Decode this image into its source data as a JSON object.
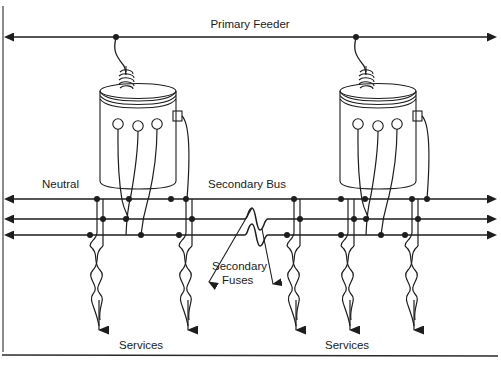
{
  "figure": {
    "kind": "electrical-one-line-diagram",
    "background_color": "#ffffff",
    "line_color": "#1d1d1d",
    "text_color": "#1b1b1b"
  },
  "labels": {
    "primary_feeder": "Primary Feeder",
    "neutral": "Neutral",
    "secondary_bus": "Secondary Bus",
    "secondary_fuses_line1": "Secondary",
    "secondary_fuses_line2": "Fuses",
    "services_left": "Services",
    "services_right": "Services"
  },
  "geometry": {
    "primary_feeder_y": 37,
    "bus_lines_y": [
      199,
      219,
      235
    ],
    "bus_left_x": 14,
    "bus_right_x": 487,
    "feeder_left_x": 14,
    "feeder_right_x": 487,
    "transformer_tap_x": [
      116,
      356
    ],
    "service_drop_x": [
      97,
      186,
      294,
      348,
      412
    ],
    "fuse_x": [
      256,
      256
    ],
    "frame_bottom_y": 355,
    "frame_left_x": 3
  },
  "components": {
    "transformers": [
      {
        "name": "transformer-left",
        "x": 100,
        "y": 80,
        "width": 78,
        "height": 100,
        "bushings": 3
      },
      {
        "name": "transformer-right",
        "x": 340,
        "y": 80,
        "width": 78,
        "height": 100,
        "bushings": 3
      }
    ],
    "service_drops": 5,
    "bus_conductor_count": 3,
    "fuse_count": 2,
    "feeder_arrow_direction": "both-ends",
    "bus_arrow_direction": "both-ends"
  }
}
